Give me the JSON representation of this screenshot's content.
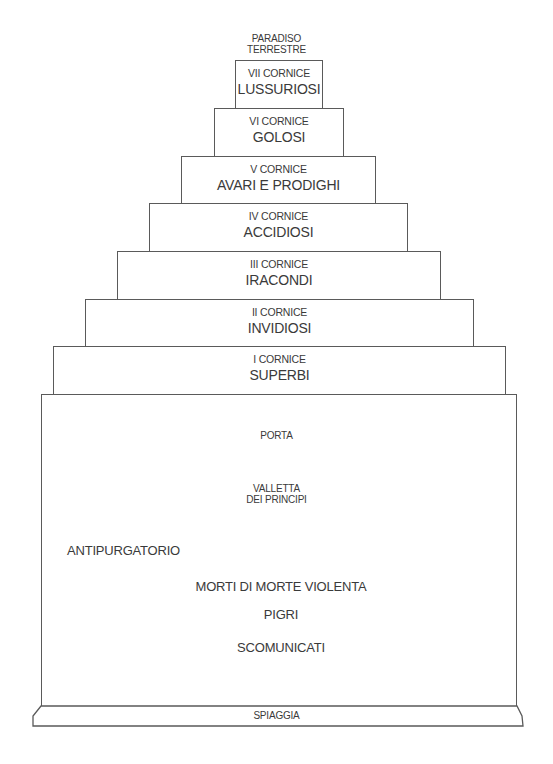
{
  "diagram": {
    "title": "Purgatorio",
    "summit": {
      "line1": "PARADISO",
      "line2": "TERRESTRE"
    },
    "cornici": [
      {
        "number": "VII CORNICE",
        "sinners": "LUSSURIOSI"
      },
      {
        "number": "VI CORNICE",
        "sinners": "GOLOSI"
      },
      {
        "number": "V CORNICE",
        "sinners": "AVARI E PRODIGHI"
      },
      {
        "number": "IV CORNICE",
        "sinners": "ACCIDIOSI"
      },
      {
        "number": "III CORNICE",
        "sinners": "IRACONDI"
      },
      {
        "number": "II CORNICE",
        "sinners": "INVIDIOSI"
      },
      {
        "number": "I CORNICE",
        "sinners": "SUPERBI"
      }
    ],
    "base": {
      "porta": "PORTA",
      "valletta": {
        "line1": "VALLETTA",
        "line2": "DEI PRINCIPI"
      },
      "antipurgatorio": "ANTIPURGATORIO",
      "groups": [
        "MORTI DI MORTE VIOLENTA",
        "PIGRI",
        "SCOMUNICATI"
      ]
    },
    "shore": "SPIAGGIA",
    "line_color": "#5a5a5a",
    "text_color": "#3a3a3a"
  }
}
